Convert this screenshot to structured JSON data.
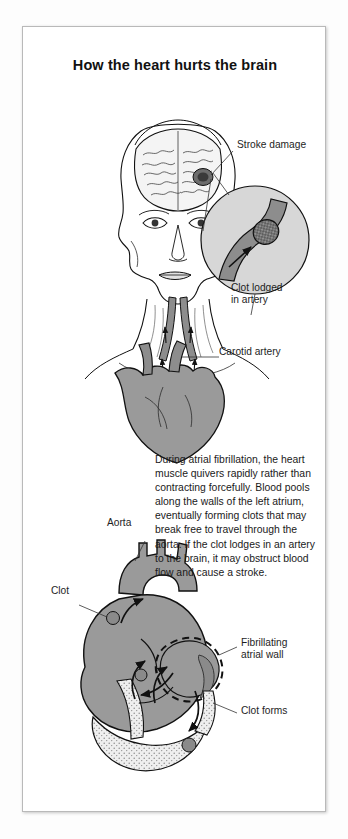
{
  "figure": {
    "title": "How the heart hurts the brain",
    "background_color": "#ffffff",
    "frame_color": "#b9b9b9",
    "tissue_fill": "#9a9a9a",
    "vessel_fill": "#8d8d8d",
    "clot_fill": "#5a5a5a",
    "outline_color": "#111111",
    "inset_fill": "#d7d7d7"
  },
  "upper_diagram": {
    "name": "head-and-heart-circulation",
    "labels": [
      {
        "id": "stroke-damage",
        "text": "Stroke damage"
      },
      {
        "id": "clot-lodged-in-artery",
        "text": "Clot lodged\nin artery"
      },
      {
        "id": "carotid-artery",
        "text": "Carotid artery"
      }
    ]
  },
  "body_text": "During atrial fibrillation, the heart muscle quivers rapidly rather than contracting forcefully. Blood pools along the walls of the left atrium, eventually forming clots that may break free to travel through the aorta. If the clot lodges in an artery to the brain, it may obstruct blood flow and cause a stroke.",
  "lower_diagram": {
    "name": "heart-cross-section",
    "labels": [
      {
        "id": "aorta",
        "text": "Aorta"
      },
      {
        "id": "clot",
        "text": "Clot"
      },
      {
        "id": "fibrillating-atrial-wall",
        "text": "Fibrillating\natrial wall"
      },
      {
        "id": "clot-forms",
        "text": "Clot forms"
      }
    ]
  }
}
